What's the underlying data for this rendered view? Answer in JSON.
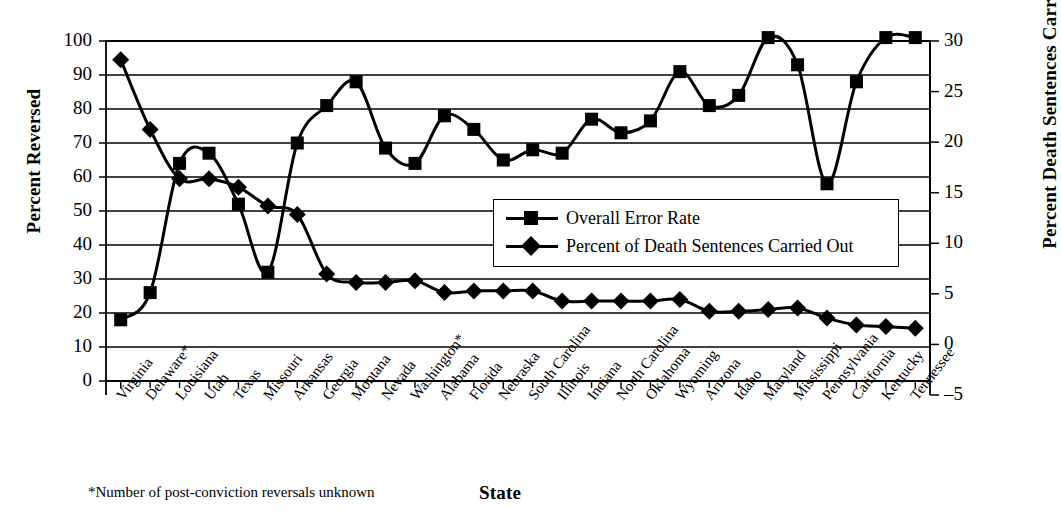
{
  "chart_data": {
    "type": "line",
    "title": "",
    "xlabel": "State",
    "ylabel": "Percent Reversed",
    "y2label": "Percent Death Sentences Carried Out",
    "ylim": [
      0,
      100
    ],
    "yticks": [
      0,
      10,
      20,
      30,
      40,
      50,
      60,
      70,
      80,
      90,
      100
    ],
    "y2lim": [
      -5,
      30
    ],
    "y2ticks": [
      -5,
      0,
      5,
      10,
      15,
      20,
      25,
      30
    ],
    "grid": true,
    "legend_position": "center-right",
    "footnote": "*Number of post-conviction reversals unknown",
    "categories": [
      "Virginia",
      "Delaware*",
      "Louisiana",
      "Utah",
      "Texas",
      "Missouri",
      "Arkansas",
      "Georgia",
      "Montana",
      "Nevada",
      "Washington*",
      "Alabama",
      "Florida",
      "Nebraska",
      "South Carolina",
      "Illinois",
      "Indiana",
      "North Carolina",
      "Oklahoma",
      "Wyoming",
      "Arizona",
      "Idaho",
      "Maryland",
      "Mississippi",
      "Pennsylvania",
      "California",
      "Kentucky",
      "Tennessee"
    ],
    "series": [
      {
        "name": "Overall Error Rate",
        "axis": "left",
        "marker": "square",
        "values": [
          18,
          26,
          64,
          67,
          52,
          32,
          70,
          81,
          88,
          68.5,
          64,
          78,
          74,
          65,
          68,
          67,
          77,
          73,
          76.5,
          91,
          81,
          84,
          101,
          93,
          58,
          88,
          101,
          101
        ]
      },
      {
        "name": "Percent of Death Sentences Carried Out",
        "axis": "right",
        "marker": "diamond",
        "values_left_scale": [
          94.5,
          74,
          59.5,
          59.5,
          57,
          51.5,
          49,
          31.5,
          29,
          29,
          29.5,
          26,
          26.5,
          26.5,
          26.5,
          23.5,
          23.5,
          23.5,
          23.5,
          24,
          20.5,
          20.5,
          21,
          21.5,
          18.5,
          16.5,
          16,
          15.5
        ],
        "values": [
          26.1,
          23.1,
          21.0,
          21.0,
          19.7,
          18.9,
          18.1,
          11.6,
          9.9,
          9.9,
          9.9,
          9.3,
          9.4,
          9.4,
          9.4,
          8.9,
          8.9,
          8.9,
          8.9,
          8.9,
          8.1,
          8.1,
          8.1,
          8.2,
          7.7,
          7.4,
          7.3,
          7.2
        ]
      }
    ]
  },
  "legend": {
    "items": [
      {
        "label": "Overall Error Rate"
      },
      {
        "label": "Percent of Death Sentences Carried Out"
      }
    ]
  },
  "colors": {
    "line": "#000000",
    "marker": "#000000",
    "grid": "#000000",
    "background": "#ffffff"
  }
}
